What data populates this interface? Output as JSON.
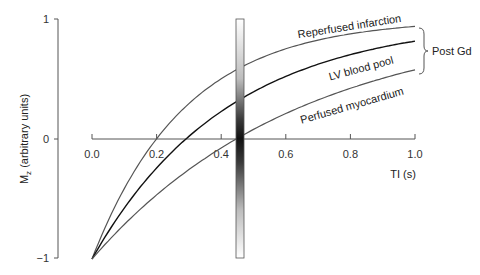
{
  "chart_data": {
    "type": "line",
    "title": "",
    "xlabel": "TI (s)",
    "ylabel": "M_z (arbitrary units)",
    "ylabel_main": "M",
    "ylabel_sub": "z",
    "ylabel_rest": " (arbitrary units)",
    "xlim": [
      0.0,
      1.0
    ],
    "ylim": [
      -1,
      1
    ],
    "x_ticks": [
      "0.0",
      "0.2",
      "0.4",
      "0.6",
      "0.8",
      "1.0"
    ],
    "y_ticks": [
      "1",
      "0",
      "−1"
    ],
    "grid": false,
    "x": [
      0.0,
      0.05,
      0.1,
      0.15,
      0.2,
      0.25,
      0.3,
      0.35,
      0.4,
      0.45,
      0.5,
      0.55,
      0.6,
      0.65,
      0.7,
      0.75,
      0.8,
      0.85,
      0.9,
      0.95,
      1.0
    ],
    "series": [
      {
        "name": "Reperfused infarction",
        "color": "#555555",
        "values": [
          -1.0,
          -0.682,
          -0.418,
          -0.192,
          0.002,
          0.166,
          0.305,
          0.424,
          0.524,
          0.609,
          0.682,
          0.743,
          0.795,
          0.839,
          0.877,
          0.909,
          0.936,
          0.959,
          0.978,
          0.993,
          0.937
        ]
      },
      {
        "name": "LV blood pool",
        "color": "#111111",
        "values": [
          -1.0,
          -0.775,
          -0.575,
          -0.398,
          -0.24,
          -0.101,
          0.023,
          0.133,
          0.231,
          0.317,
          0.393,
          0.461,
          0.522,
          0.575,
          0.622,
          0.664,
          0.701,
          0.734,
          0.764,
          0.79,
          0.815
        ]
      },
      {
        "name": "Perfused myocardium",
        "color": "#555555",
        "values": [
          -1.0,
          -0.853,
          -0.716,
          -0.589,
          -0.471,
          -0.361,
          -0.259,
          -0.164,
          -0.076,
          0.006,
          0.082,
          0.153,
          0.218,
          0.279,
          0.336,
          0.388,
          0.437,
          0.482,
          0.524,
          0.563,
          0.6
        ]
      }
    ],
    "annotations": [
      {
        "text": "Post Gd",
        "type": "brace-label",
        "applies_to": [
          "Reperfused infarction",
          "LV blood pool",
          "Perfused myocardium"
        ]
      },
      {
        "text": "Inversion time selector",
        "type": "vertical-gradient-bar",
        "x": 0.47,
        "visible_text": false
      }
    ],
    "legend": "inline labels along curves"
  },
  "labels": {
    "infarction": "Reperfused infarction",
    "blood_pool": "LV blood pool",
    "myocardium": "Perfused myocardium",
    "brace": "Post Gd",
    "xlabel": "TI (s)",
    "ylabel_main": "M",
    "ylabel_sub": "z",
    "ylabel_rest": " (arbitrary units)"
  },
  "ticks": {
    "x": [
      "0.0",
      "0.2",
      "0.4",
      "0.6",
      "0.8",
      "1.0"
    ],
    "y1": "1",
    "y0": "0",
    "ym1": "−1"
  }
}
